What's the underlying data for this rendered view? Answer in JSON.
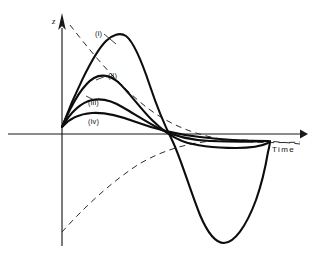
{
  "chart_data": {
    "type": "line",
    "title": "",
    "subtitle": "",
    "xlabel": "Time",
    "ylabel": "z",
    "xlim": [
      0,
      321
    ],
    "ylim": [
      0,
      266
    ],
    "grid": false,
    "legend_position": "inline-annotations",
    "axes": {
      "x_axis_y_px": 134,
      "y_axis_x_px": 62,
      "origin_px": [
        62,
        134
      ],
      "x_arrow_tip_px": [
        305,
        134
      ],
      "y_arrow_tip_px": [
        62,
        14
      ],
      "x_axis_start_px": [
        8,
        134
      ],
      "y_axis_bottom_px": [
        62,
        246
      ]
    },
    "annotations": [
      {
        "id": "i",
        "label": "(i)",
        "x_px": 95,
        "y_px": 30
      },
      {
        "id": "ii",
        "label": "(ii)",
        "x_px": 108,
        "y_px": 72
      },
      {
        "id": "iii",
        "label": "(iii)",
        "x_px": 88,
        "y_px": 99
      },
      {
        "id": "iv",
        "label": "(iv)",
        "x_px": 88,
        "y_px": 118
      },
      {
        "id": "time",
        "label": "Time",
        "x_px": 272,
        "y_px": 146
      },
      {
        "id": "z",
        "label": "z",
        "x_px": 52,
        "y_px": 17
      }
    ],
    "series": [
      {
        "name": "(i)",
        "style": "solid",
        "description": "largest amplitude oscillatory response: rises to high peak, crosses zero, deep undershoot, returns",
        "path": "M 62 127 C 72 100, 92 55, 106 41 C 112 35, 120 32, 126 36 C 134 42, 142 62, 150 86 C 158 110, 166 128, 172 140 C 180 156, 190 190, 200 215 C 208 234, 216 243, 224 243 C 234 243, 246 227, 256 200 C 262 183, 266 164, 268 152 C 270 144, 270 142, 270 141"
      },
      {
        "name": "(ii)",
        "style": "solid",
        "description": "second amplitude: moderate peak then decays through zero to small negative then returns",
        "path": "M 62 127 C 70 108, 82 85, 94 78 C 101 74, 110 75, 118 82 C 128 91, 140 108, 152 120 C 162 130, 172 137, 182 141 C 196 146, 216 148, 236 148 C 250 148, 262 146, 268 143"
      },
      {
        "name": "(iii)",
        "style": "solid",
        "description": "third amplitude: low broad hump decaying toward axis",
        "path": "M 62 127 C 69 115, 79 103, 92 100 C 102 98, 113 101, 124 108 C 136 115, 150 124, 162 130 C 174 136, 190 140, 210 141 C 232 142, 254 142, 268 141"
      },
      {
        "name": "(iv)",
        "style": "solid",
        "description": "smallest amplitude: very flat hump approaching axis monotonically",
        "path": "M 62 127 C 68 120, 78 114, 92 113 C 106 112, 120 116, 136 122 C 152 128, 174 134, 200 137 C 224 140, 250 141, 268 141"
      }
    ],
    "envelopes": [
      {
        "name": "upper-envelope",
        "style": "dashed",
        "description": "decaying exponential envelope from high on vertical axis toward axis asymptote",
        "path": "M 70 25 C 88 48, 112 78, 140 102 C 166 124, 196 136, 228 140 C 254 143, 280 143, 300 142"
      },
      {
        "name": "lower-envelope",
        "style": "dashed",
        "description": "mirror envelope rising from low on vertical axis toward axis asymptote",
        "path": "M 62 232 C 80 212, 106 186, 136 166 C 166 147, 200 140, 232 140 C 258 140, 282 142, 300 144"
      }
    ],
    "leaders": [
      {
        "name": "leader-i",
        "path": "M 104 34 L 116 44"
      },
      {
        "name": "leader-ii",
        "path": "M 106 76 L 96 80"
      },
      {
        "name": "leader-iii",
        "path": "M 86 96 L 94 100"
      }
    ]
  }
}
